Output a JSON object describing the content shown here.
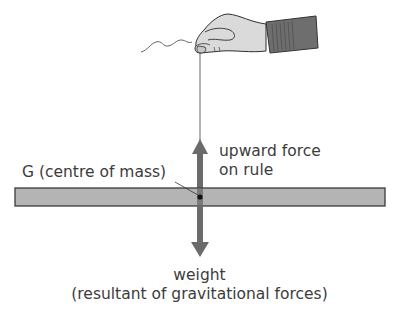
{
  "diagram": {
    "labels": {
      "upward_force_line1": "upward force",
      "upward_force_line2": "on rule",
      "centre_of_mass": "G (centre of mass)",
      "weight_line1": "weight",
      "weight_line2": "(resultant of gravitational forces)"
    },
    "elements": {
      "hand": "hand-holding-string",
      "string": "string",
      "rule": "rule",
      "upward_arrow": "upward-force-arrow",
      "downward_arrow": "weight-arrow",
      "centre_point": "G"
    },
    "colors": {
      "arrow": "#6b6b6b",
      "rule_fill": "#b4b4b4",
      "rule_border": "#3a3a3a",
      "hand_fill": "#d9d9d9",
      "sleeve_fill": "#6e6e6e",
      "text": "#3c3c3c"
    }
  }
}
